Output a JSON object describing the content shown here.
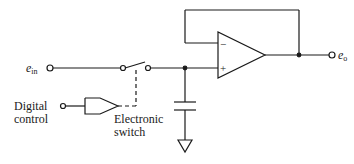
{
  "diagram": {
    "type": "sample-and-hold circuit",
    "labels": {
      "input_var": "e",
      "input_sub": "in",
      "output_var": "e",
      "output_sub": "o",
      "digital_control_line1": "Digital",
      "digital_control_line2": "control",
      "switch_line1": "Electronic",
      "switch_line2": "switch",
      "opamp_minus": "−",
      "opamp_plus": "+"
    },
    "components": [
      "input terminal",
      "electronic switch",
      "digital control buffer",
      "hold capacitor",
      "ground",
      "op-amp voltage follower",
      "output terminal"
    ],
    "colors": {
      "ink": "#1a1a1a",
      "background": "#ffffff"
    }
  }
}
